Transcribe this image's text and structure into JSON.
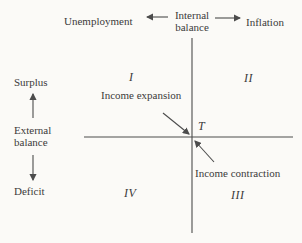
{
  "diagram": {
    "title_axis_top": {
      "left_label": "Unemployment",
      "center_label_line1": "Internal",
      "center_label_line2": "balance",
      "right_label": "Inflation"
    },
    "axis_left": {
      "top_label": "Surplus",
      "center_label_line1": "External",
      "center_label_line2": "balance",
      "bottom_label": "Deficit"
    },
    "quadrants": {
      "q1": "I",
      "q2": "II",
      "q3": "III",
      "q4": "IV"
    },
    "annotations": {
      "income_expansion": "Income expansion",
      "income_contraction": "Income contraction",
      "equilibrium_point": "T"
    },
    "colors": {
      "background": "#fbfaf7",
      "ink": "#3b3b3b",
      "line": "#4c4c4c"
    }
  }
}
